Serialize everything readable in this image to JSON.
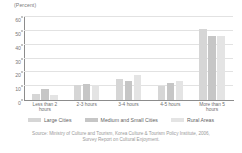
{
  "chart_data": {
    "type": "bar",
    "title": "",
    "subtitle": "",
    "unit_label": "(Percent)",
    "xlabel": "",
    "ylabel": "",
    "ylim": [
      0,
      60
    ],
    "yticks": [
      0,
      10,
      20,
      30,
      40,
      50,
      60
    ],
    "ytick_labels": [
      "0",
      "10",
      "20",
      "30",
      "40",
      "50",
      "60"
    ],
    "grid": true,
    "grid_axis": "y",
    "legend_position": "bottom",
    "categories": [
      "Less than 2\nhours",
      "2-3 hours",
      "3-4 hours",
      "4-5 hours",
      "More than 5\nhours"
    ],
    "series": [
      {
        "name": "Large Cities",
        "color": "#d6d6d6",
        "values": [
          4.0,
          10.5,
          15.0,
          10.0,
          51.0
        ]
      },
      {
        "name": "Medium and Small Cities",
        "color": "#c6c6c6",
        "values": [
          8.0,
          11.5,
          14.0,
          12.5,
          46.0
        ]
      },
      {
        "name": "Rural Areas",
        "color": "#e4e4e4",
        "values": [
          3.5,
          10.5,
          18.0,
          13.5,
          46.5
        ]
      }
    ],
    "source": [
      "Source: Ministry of Culture and Tourism, Korea Culture & Tourism Policy Institute, 2006,",
      "Survey Report on Cultural Enjoyment."
    ]
  }
}
